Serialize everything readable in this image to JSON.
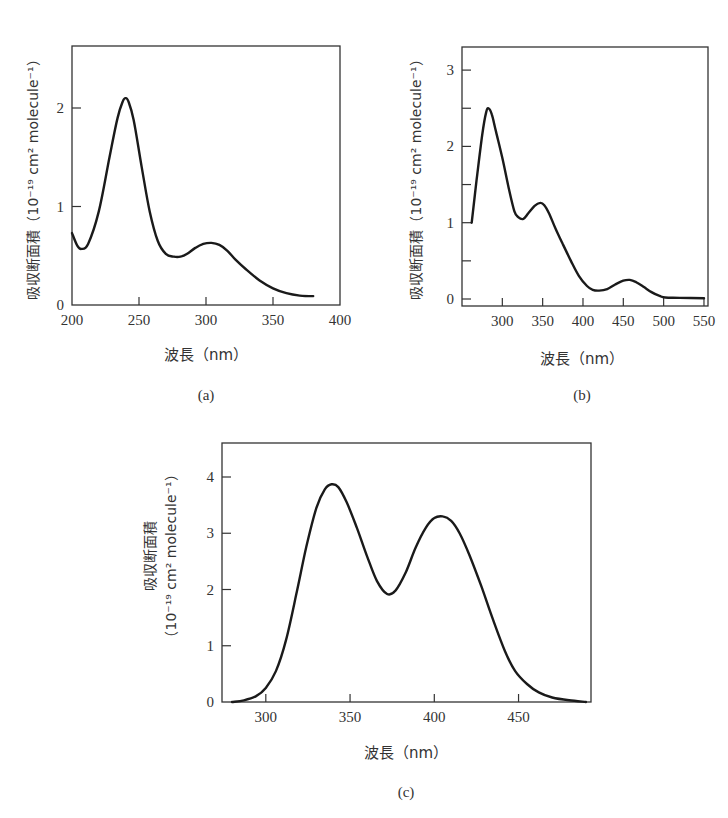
{
  "chart_data": [
    {
      "id": "a",
      "type": "line",
      "panel_label": "(a)",
      "title": "",
      "xlabel": "波長（nm）",
      "ylabel": "吸収断面積（10⁻¹⁹ cm² molecule⁻¹）",
      "xlim": [
        200,
        400
      ],
      "ylim": [
        0,
        2.65
      ],
      "xticks": [
        200,
        250,
        300,
        350,
        400
      ],
      "yticks": [
        0,
        1,
        2
      ],
      "grid": false,
      "legend": null,
      "series": [
        {
          "name": "absorption cross section",
          "x": [
            200,
            204,
            207,
            212,
            220,
            228,
            234,
            238,
            240,
            242,
            246,
            252,
            258,
            264,
            270,
            276,
            281,
            286,
            292,
            298,
            304,
            310,
            316,
            322,
            330,
            340,
            350,
            360,
            370,
            380
          ],
          "y": [
            0.73,
            0.6,
            0.57,
            0.62,
            0.95,
            1.5,
            1.9,
            2.07,
            2.1,
            2.07,
            1.88,
            1.4,
            0.95,
            0.65,
            0.52,
            0.49,
            0.49,
            0.52,
            0.58,
            0.62,
            0.63,
            0.61,
            0.55,
            0.46,
            0.36,
            0.25,
            0.17,
            0.12,
            0.095,
            0.09
          ]
        }
      ]
    },
    {
      "id": "b",
      "type": "line",
      "panel_label": "(b)",
      "title": "",
      "xlabel": "波長（nm）",
      "ylabel": "吸収断面積（10⁻¹⁹ cm² molecule⁻¹）",
      "xlim": [
        250,
        555
      ],
      "ylim": [
        0,
        3.3
      ],
      "xticks": [
        300,
        350,
        400,
        450,
        500,
        550
      ],
      "yticks": [
        0,
        1,
        2,
        3
      ],
      "yminor_ticks": [
        0.5,
        1.5,
        2.5
      ],
      "grid": false,
      "legend": null,
      "series": [
        {
          "name": "absorption cross section",
          "x": [
            262,
            268,
            275,
            280,
            283,
            287,
            292,
            300,
            308,
            315,
            320,
            326,
            332,
            340,
            347,
            352,
            358,
            366,
            375,
            385,
            395,
            405,
            412,
            420,
            430,
            440,
            450,
            458,
            466,
            475,
            485,
            495,
            502,
            520,
            550
          ],
          "y": [
            1.0,
            1.55,
            2.15,
            2.45,
            2.5,
            2.42,
            2.2,
            1.85,
            1.45,
            1.15,
            1.07,
            1.05,
            1.12,
            1.22,
            1.26,
            1.23,
            1.12,
            0.92,
            0.72,
            0.5,
            0.3,
            0.17,
            0.12,
            0.11,
            0.13,
            0.19,
            0.24,
            0.25,
            0.22,
            0.16,
            0.09,
            0.04,
            0.02,
            0.015,
            0.01
          ]
        }
      ]
    },
    {
      "id": "c",
      "type": "line",
      "panel_label": "(c)",
      "title": "",
      "xlabel": "波長（nm）",
      "ylabel": "吸収断面積",
      "ylabel_line2": "（10⁻¹⁹ cm² molecule⁻¹）",
      "xlim": [
        274,
        493
      ],
      "ylim": [
        0,
        4.6
      ],
      "xticks": [
        300,
        350,
        400,
        450
      ],
      "yticks": [
        0,
        1,
        2,
        3,
        4
      ],
      "grid": false,
      "legend": null,
      "series": [
        {
          "name": "absorption cross section",
          "x": [
            280,
            287,
            294,
            300,
            306,
            312,
            318,
            324,
            330,
            335,
            339,
            343,
            348,
            354,
            360,
            366,
            372,
            377,
            383,
            389,
            395,
            400,
            405,
            410,
            415,
            421,
            428,
            435,
            442,
            448,
            455,
            462,
            470,
            480,
            490
          ],
          "y": [
            0.0,
            0.03,
            0.1,
            0.25,
            0.55,
            1.1,
            1.9,
            2.75,
            3.45,
            3.78,
            3.87,
            3.82,
            3.55,
            3.1,
            2.6,
            2.15,
            1.92,
            1.98,
            2.3,
            2.75,
            3.1,
            3.27,
            3.3,
            3.22,
            3.0,
            2.6,
            2.05,
            1.45,
            0.9,
            0.55,
            0.32,
            0.17,
            0.08,
            0.03,
            0.0
          ]
        }
      ]
    }
  ],
  "layout": {
    "a": {
      "left": 72,
      "right": 340,
      "top": 46,
      "bottom": 305,
      "y0px": 305,
      "ypx_per_unit": 98.5
    },
    "b": {
      "left": 462,
      "right": 708,
      "top": 47,
      "bottom": 306,
      "y0px": 299,
      "ypx_per_unit": 76.3
    },
    "c": {
      "left": 222,
      "right": 591,
      "top": 443,
      "bottom": 702,
      "y0px": 702,
      "ypx_per_unit": 56.25
    }
  },
  "labels": {
    "a_panel": "(a)",
    "b_panel": "(b)",
    "c_panel": "(c)",
    "xlabel": "波長（nm）",
    "ylabel_full": "吸収断面積（10⁻¹⁹ cm² molecule⁻¹）",
    "ylabel_top": "吸収断面積",
    "ylabel_unit": "（10⁻¹⁹ cm² molecule⁻¹）"
  }
}
